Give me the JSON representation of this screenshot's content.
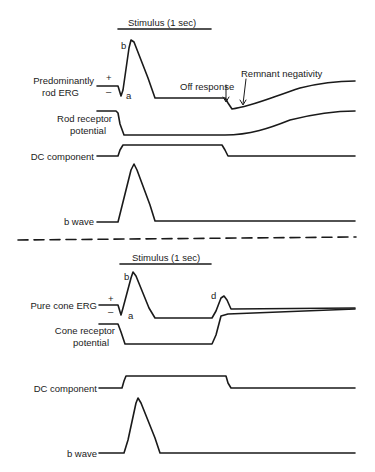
{
  "top_panel": {
    "stimulus_label": "Stimulus (1 sec)",
    "traces": [
      {
        "label_line1": "Predominantly",
        "label_line2": "rod ERG"
      },
      {
        "label_line1": "Rod receptor",
        "label_line2": "potential"
      },
      {
        "label": "DC component"
      },
      {
        "label": "b wave"
      }
    ],
    "annotations": {
      "plus": "+",
      "minus": "–",
      "a": "a",
      "b": "b",
      "off_response": "Off response",
      "remnant_negativity": "Remnant negativity"
    }
  },
  "bottom_panel": {
    "stimulus_label": "Stimulus (1 sec)",
    "traces": [
      {
        "label": "Pure cone ERG"
      },
      {
        "label_line1": "Cone receptor",
        "label_line2": "potential"
      },
      {
        "label": "DC component"
      },
      {
        "label": "b wave"
      }
    ],
    "annotations": {
      "plus": "+",
      "minus": "–",
      "a": "a",
      "b": "b",
      "d": "d"
    }
  }
}
